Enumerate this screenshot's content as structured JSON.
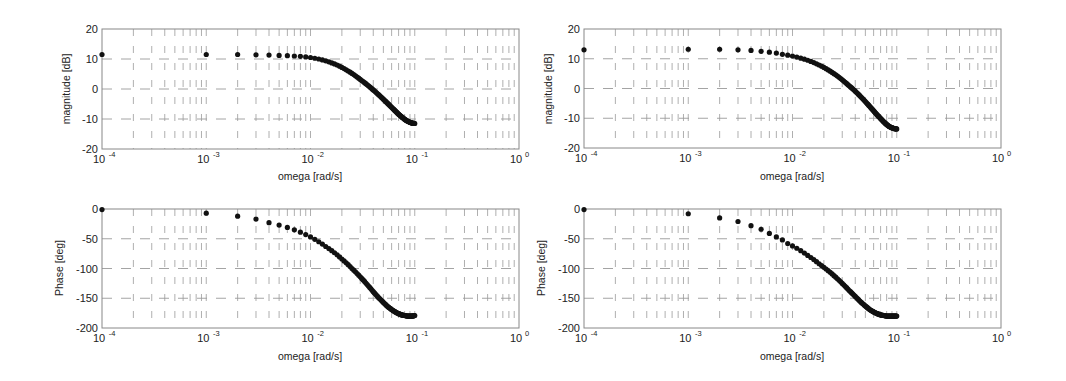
{
  "chart_data": [
    {
      "id": "left-magnitude",
      "type": "scatter",
      "title": "",
      "xlabel": "omega [rad/s]",
      "ylabel": "magnitude [dB]",
      "xscale": "log",
      "xlim": [
        0.0001,
        1
      ],
      "ylim": [
        -20,
        20
      ],
      "xticks": [
        "10^-4",
        "10^-3",
        "10^-2",
        "10^-1",
        "10^0"
      ],
      "yticks": [
        20,
        10,
        0,
        -10,
        -20
      ],
      "grid": true,
      "x": [
        0.0001,
        0.001,
        0.002,
        0.003,
        0.004,
        0.005,
        0.006,
        0.007,
        0.008,
        0.009,
        0.01,
        0.012,
        0.014,
        0.016,
        0.018,
        0.02,
        0.025,
        0.03,
        0.035,
        0.04,
        0.045,
        0.05,
        0.055,
        0.06,
        0.065,
        0.07,
        0.075,
        0.08,
        0.085,
        0.09,
        0.095,
        0.1
      ],
      "y": [
        11.5,
        11.5,
        11.5,
        11.4,
        11.3,
        11.2,
        11.1,
        11.0,
        10.9,
        10.7,
        10.5,
        10.0,
        9.4,
        8.7,
        8.0,
        7.2,
        5.2,
        3.2,
        1.4,
        -0.3,
        -1.9,
        -3.4,
        -4.8,
        -6.1,
        -7.3,
        -8.4,
        -9.3,
        -10.1,
        -10.7,
        -11.1,
        -11.4,
        -11.5
      ]
    },
    {
      "id": "left-phase",
      "type": "scatter",
      "title": "",
      "xlabel": "omega [rad/s]",
      "ylabel": "Phase [deg]",
      "xscale": "log",
      "xlim": [
        0.0001,
        1
      ],
      "ylim": [
        -200,
        0
      ],
      "xticks": [
        "10^-4",
        "10^-3",
        "10^-2",
        "10^-1",
        "10^0"
      ],
      "yticks": [
        0,
        -50,
        -100,
        -150,
        -200
      ],
      "grid": true,
      "x": [
        0.0001,
        0.001,
        0.002,
        0.003,
        0.004,
        0.005,
        0.006,
        0.007,
        0.008,
        0.009,
        0.01,
        0.012,
        0.014,
        0.016,
        0.018,
        0.02,
        0.025,
        0.03,
        0.035,
        0.04,
        0.045,
        0.05,
        0.055,
        0.06,
        0.065,
        0.07,
        0.075,
        0.08,
        0.085,
        0.09,
        0.095,
        0.1
      ],
      "y": [
        -1,
        -7,
        -12,
        -17,
        -23,
        -27,
        -31,
        -35,
        -39,
        -43,
        -47,
        -55,
        -63,
        -70,
        -77,
        -84,
        -100,
        -114,
        -127,
        -139,
        -149,
        -157,
        -164,
        -169,
        -173,
        -176,
        -178,
        -179,
        -180,
        -180,
        -180,
        -179
      ]
    },
    {
      "id": "right-magnitude",
      "type": "scatter",
      "title": "",
      "xlabel": "omega [rad/s]",
      "ylabel": "magnitude [dB]",
      "xscale": "log",
      "xlim": [
        0.0001,
        1
      ],
      "ylim": [
        -20,
        20
      ],
      "xticks": [
        "10^-4",
        "10^-3",
        "10^-2",
        "10^-1",
        "10^0"
      ],
      "yticks": [
        20,
        10,
        0,
        -10,
        -20
      ],
      "grid": true,
      "x": [
        0.0001,
        0.001,
        0.002,
        0.003,
        0.004,
        0.005,
        0.006,
        0.007,
        0.008,
        0.009,
        0.01,
        0.012,
        0.014,
        0.016,
        0.018,
        0.02,
        0.025,
        0.03,
        0.035,
        0.04,
        0.045,
        0.05,
        0.055,
        0.06,
        0.065,
        0.07,
        0.075,
        0.08,
        0.085,
        0.09,
        0.095,
        0.1
      ],
      "y": [
        13.0,
        13.2,
        13.2,
        13.0,
        12.8,
        12.5,
        12.2,
        11.9,
        11.5,
        11.2,
        10.9,
        10.2,
        9.5,
        8.7,
        7.9,
        7.1,
        5.0,
        2.9,
        0.9,
        -0.9,
        -2.7,
        -4.4,
        -6.0,
        -7.5,
        -8.9,
        -10.1,
        -11.2,
        -12.1,
        -12.8,
        -13.2,
        -13.5,
        -13.6
      ]
    },
    {
      "id": "right-phase",
      "type": "scatter",
      "title": "",
      "xlabel": "omega [rad/s]",
      "ylabel": "Phase [deg]",
      "xscale": "log",
      "xlim": [
        0.0001,
        1
      ],
      "ylim": [
        -200,
        0
      ],
      "xticks": [
        "10^-4",
        "10^-3",
        "10^-2",
        "10^-1",
        "10^0"
      ],
      "yticks": [
        0,
        -50,
        -100,
        -150,
        -200
      ],
      "grid": true,
      "x": [
        0.0001,
        0.001,
        0.002,
        0.003,
        0.004,
        0.005,
        0.006,
        0.007,
        0.008,
        0.009,
        0.01,
        0.012,
        0.014,
        0.016,
        0.018,
        0.02,
        0.025,
        0.03,
        0.035,
        0.04,
        0.045,
        0.05,
        0.055,
        0.06,
        0.065,
        0.07,
        0.075,
        0.08,
        0.085,
        0.09,
        0.095,
        0.1
      ],
      "y": [
        -1,
        -8,
        -15,
        -21,
        -28,
        -34,
        -41,
        -47,
        -52,
        -58,
        -62,
        -70,
        -78,
        -85,
        -92,
        -98,
        -112,
        -125,
        -137,
        -147,
        -156,
        -163,
        -169,
        -173,
        -176,
        -178,
        -179,
        -180,
        -180,
        -180,
        -180,
        -180
      ]
    }
  ],
  "panels": {
    "left_magnitude": {
      "ylabel": "magnitude [dB]",
      "xlabel": "omega [rad/s]"
    },
    "left_phase": {
      "ylabel": "Phase [deg]",
      "xlabel": "omega [rad/s]"
    },
    "right_magnitude": {
      "ylabel": "magnitude [dB]",
      "xlabel": "omega [rad/s]"
    },
    "right_phase": {
      "ylabel": "Phase [deg]",
      "xlabel": "omega [rad/s]"
    }
  },
  "style": {
    "marker_color": "#111111",
    "axis_color": "#888888",
    "grid_color": "#9a9a9a",
    "text_color": "#222222"
  }
}
